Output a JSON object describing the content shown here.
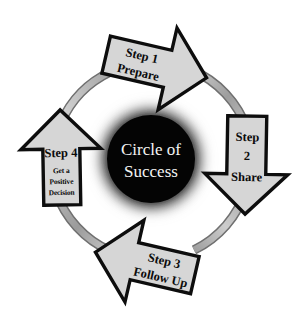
{
  "diagram": {
    "title": "Circle of Success",
    "type": "cycle",
    "background_color": "#ffffff",
    "hub": {
      "name": "circle-of-success-hub",
      "line1": "Circle of",
      "line2": "Success",
      "fill_color": "#050505",
      "text_color": "#f4f4f4",
      "glow_color": "#1a1a1a"
    },
    "ring": {
      "name": "cycle-ring",
      "fill_color": "#b0b0b0",
      "stroke_color": "#6e6e6e",
      "highlight_color": "#d8d8d8"
    },
    "arrow_style": {
      "fill_color": "#d6d6d6",
      "stroke_color": "#0d0d0d"
    },
    "steps": [
      {
        "id": "step-1",
        "number": "Step 1",
        "title": "Prepare",
        "subtitle": "",
        "direction": "right",
        "position": "top"
      },
      {
        "id": "step-2",
        "number": "Step",
        "number_line2": "2",
        "title": "Share",
        "subtitle": "",
        "direction": "down",
        "position": "right"
      },
      {
        "id": "step-3",
        "number": "Step 3",
        "title": "Follow Up",
        "subtitle": "",
        "direction": "left",
        "position": "bottom"
      },
      {
        "id": "step-4",
        "number": "Step 4",
        "title": "",
        "subtitle_line1": "Get a",
        "subtitle_line2": "Positive",
        "subtitle_line3": "Decision",
        "direction": "up",
        "position": "left"
      }
    ]
  }
}
